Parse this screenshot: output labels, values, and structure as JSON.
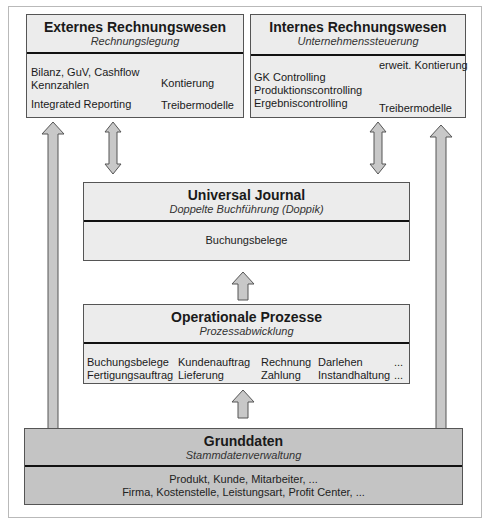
{
  "extern": {
    "title": "Externes Rechnungswesen",
    "subtitle": "Rechnungslegung",
    "items": [
      "Bilanz, GuV, Cashflow",
      "Kennzahlen",
      "Integrated Reporting"
    ],
    "targets": [
      "Kontierung",
      "Treibermodelle"
    ]
  },
  "intern": {
    "title": "Internes Rechnungswesen",
    "subtitle": "Unternehmenssteuerung",
    "items": [
      "GK Controlling",
      "Produktionscontrolling",
      "Ergebniscontrolling"
    ],
    "targets": [
      "erweit. Kontierung",
      "Treibermodelle"
    ]
  },
  "journal": {
    "title": "Universal Journal",
    "subtitle": "Doppelte Buchführung (Doppik)",
    "body": "Buchungsbelege"
  },
  "prozesse": {
    "title": "Operationale Prozesse",
    "subtitle": "Prozessabwicklung",
    "rows": [
      [
        "Buchungsbelege",
        "Kundenauftrag",
        "Rechnung",
        "Darlehen",
        "..."
      ],
      [
        "Fertigungsauftrag",
        "Lieferung",
        "Zahlung",
        "Instandhaltung",
        "..."
      ]
    ]
  },
  "grunddaten": {
    "title": "Grunddaten",
    "subtitle": "Stammdatenverwaltung",
    "lines": [
      "Produkt, Kunde, Mitarbeiter, ...",
      "Firma, Kostenstelle, Leistungsart, Profit Center, ..."
    ]
  },
  "colors": {
    "box_fill": "#ececec",
    "grunddaten_fill": "#c4c4c4",
    "arrow_fill": "#c8c8c8",
    "border": "#555555"
  }
}
